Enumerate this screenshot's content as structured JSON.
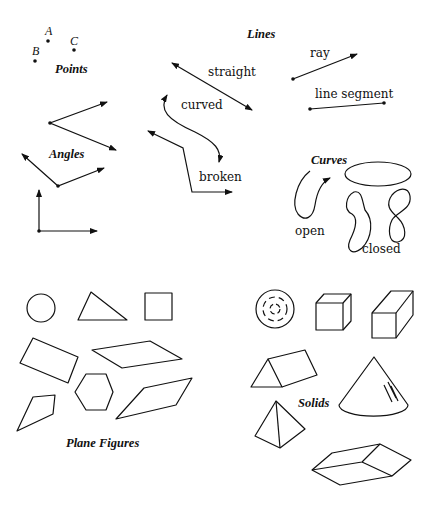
{
  "sections": {
    "points": {
      "title": "Points",
      "labels": [
        "A",
        "B",
        "C"
      ]
    },
    "lines": {
      "title": "Lines",
      "labels": {
        "straight": "straight",
        "ray": "ray",
        "line_segment": "line segment",
        "curved": "curved",
        "broken": "broken"
      }
    },
    "angles": {
      "title": "Angles"
    },
    "curves": {
      "title": "Curves",
      "labels": {
        "open": "open",
        "closed": "closed"
      }
    },
    "plane_figures": {
      "title": "Plane Figures",
      "shapes": [
        "circle",
        "triangle",
        "square",
        "rectangle",
        "parallelogram",
        "hexagon",
        "quadrilateral",
        "rhombus"
      ]
    },
    "solids": {
      "title": "Solids",
      "shapes": [
        "sphere",
        "cube",
        "rectangular-prism",
        "triangular-prism",
        "cone",
        "pyramid",
        "hexagonal-prism"
      ]
    }
  }
}
